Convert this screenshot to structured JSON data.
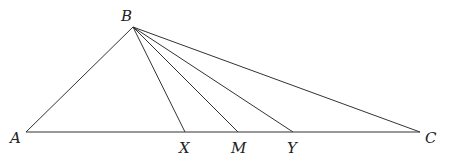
{
  "diagram": {
    "type": "geometry-triangle",
    "points": {
      "A": {
        "label": "A",
        "x": 26,
        "y": 132,
        "lx": 10,
        "ly": 143
      },
      "B": {
        "label": "B",
        "x": 133,
        "y": 27,
        "lx": 121,
        "ly": 21
      },
      "C": {
        "label": "C",
        "x": 420,
        "y": 132,
        "lx": 425,
        "ly": 143
      },
      "X": {
        "label": "X",
        "x": 185,
        "y": 132,
        "lx": 179,
        "ly": 153
      },
      "M": {
        "label": "M",
        "x": 238,
        "y": 132,
        "lx": 231,
        "ly": 153
      },
      "Y": {
        "label": "Y",
        "x": 293,
        "y": 132,
        "lx": 287,
        "ly": 153
      }
    },
    "segments": [
      [
        "A",
        "B"
      ],
      [
        "A",
        "C"
      ],
      [
        "B",
        "C"
      ],
      [
        "B",
        "X"
      ],
      [
        "B",
        "M"
      ],
      [
        "B",
        "Y"
      ]
    ],
    "stroke_color": "#333333",
    "label_color": "#222222"
  }
}
